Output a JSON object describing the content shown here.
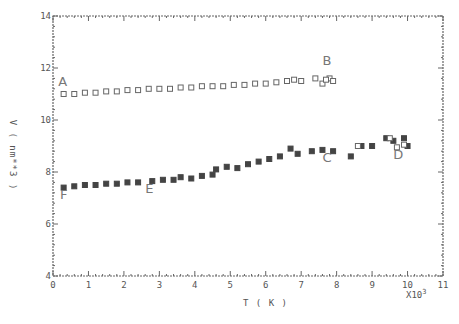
{
  "chart_data": {
    "type": "scatter",
    "title": "",
    "xlabel": "T ( K )",
    "ylabel": "V ( nm**3 )",
    "x_scale_note": "X10^3",
    "xlim": [
      0,
      11
    ],
    "ylim": [
      4,
      14
    ],
    "x_ticks": [
      "0",
      "1",
      "2",
      "3",
      "4",
      "5",
      "6",
      "7",
      "8",
      "9",
      "10",
      "11"
    ],
    "y_ticks": [
      "4",
      "6",
      "8",
      "10",
      "12",
      "14"
    ],
    "grid": false,
    "legend": null,
    "annotations": [
      {
        "text": "A",
        "x": 0.15,
        "y": 11.3
      },
      {
        "text": "B",
        "x": 7.6,
        "y": 12.1
      },
      {
        "text": "C",
        "x": 7.6,
        "y": 8.4
      },
      {
        "text": "D",
        "x": 9.6,
        "y": 8.5
      },
      {
        "text": "E",
        "x": 2.6,
        "y": 7.2
      },
      {
        "text": "F",
        "x": 0.2,
        "y": 6.95
      }
    ],
    "series": [
      {
        "name": "open (A-B)",
        "marker": "open-square",
        "x": [
          0.3,
          0.6,
          0.9,
          1.2,
          1.5,
          1.8,
          2.1,
          2.4,
          2.7,
          3.0,
          3.3,
          3.6,
          3.9,
          4.2,
          4.5,
          4.8,
          5.1,
          5.4,
          5.7,
          6.0,
          6.3,
          6.6,
          6.8,
          7.0,
          7.4,
          7.6,
          7.8,
          7.7,
          7.9
        ],
        "y": [
          11.0,
          11.0,
          11.05,
          11.05,
          11.1,
          11.1,
          11.15,
          11.15,
          11.2,
          11.2,
          11.2,
          11.25,
          11.25,
          11.3,
          11.3,
          11.3,
          11.35,
          11.35,
          11.4,
          11.4,
          11.45,
          11.5,
          11.55,
          11.5,
          11.6,
          11.4,
          11.6,
          11.55,
          11.5
        ]
      },
      {
        "name": "filled (F-E-C-D)",
        "marker": "filled-square",
        "x": [
          0.3,
          0.6,
          0.9,
          1.2,
          1.5,
          1.8,
          2.1,
          2.4,
          2.8,
          3.1,
          3.4,
          3.6,
          3.9,
          4.2,
          4.5,
          4.6,
          4.9,
          5.2,
          5.5,
          5.8,
          6.1,
          6.4,
          6.7,
          6.9,
          7.3,
          7.6,
          7.9,
          8.4,
          8.7,
          9.0,
          9.4,
          9.6,
          9.9,
          10.0
        ],
        "y": [
          7.4,
          7.45,
          7.5,
          7.5,
          7.55,
          7.55,
          7.6,
          7.6,
          7.65,
          7.7,
          7.7,
          7.8,
          7.75,
          7.85,
          7.9,
          8.1,
          8.2,
          8.15,
          8.3,
          8.4,
          8.5,
          8.6,
          8.9,
          8.7,
          8.8,
          8.85,
          8.8,
          8.6,
          9.0,
          9.0,
          9.3,
          9.2,
          9.3,
          9.0
        ]
      },
      {
        "name": "open (near D)",
        "marker": "open-square",
        "x": [
          8.6,
          9.5,
          9.7,
          9.9
        ],
        "y": [
          9.0,
          9.3,
          8.95,
          9.05
        ]
      }
    ]
  }
}
